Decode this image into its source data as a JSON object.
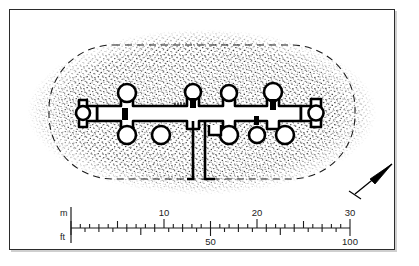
{
  "figure": {
    "frame": {
      "border_color": "#2b2b2b",
      "background_color": "#ffffff",
      "shadow_color": "#cfcfcf"
    }
  },
  "plan": {
    "mound": {
      "name": "stippled-mound",
      "shape": "rounded-rectangle-oval",
      "fill_style": "stipple",
      "stipple_color": "#1a1a1a"
    },
    "inner_boundary": {
      "name": "dashed-oval-boundary",
      "line_style": "dashed",
      "color": "#1a1a1a"
    },
    "structure": {
      "name": "walled-building-plan",
      "description": "Long east-west range with apsidal niches and a southward corridor",
      "wall_color": "#000000",
      "interior_color": "#ffffff"
    },
    "corridor": {
      "name": "southern-corridor",
      "description": "Two parallel walls descending from the main range"
    }
  },
  "north_arrow": {
    "name": "north-arrow",
    "label": "",
    "direction_degrees": 45,
    "color": "#000000"
  },
  "scale_bar": {
    "name": "dual-unit-scale-bar",
    "units": [
      {
        "name": "meters",
        "label": "m",
        "position": "top"
      },
      {
        "name": "feet",
        "label": "ft",
        "position": "bottom"
      }
    ],
    "meter_labels": [
      {
        "value": "10",
        "at": 10
      },
      {
        "value": "20",
        "at": 20
      },
      {
        "value": "30",
        "at": 30
      }
    ],
    "feet_labels": [
      {
        "value": "50",
        "at": 50
      },
      {
        "value": "100",
        "at": 100
      }
    ],
    "meter_range": [
      0,
      30
    ],
    "feet_range": [
      0,
      100
    ],
    "meter_minor_interval": 1,
    "meter_major_interval": 5,
    "feet_minor_interval": 5,
    "feet_major_interval": 10,
    "line_color": "#1c1c1c"
  }
}
